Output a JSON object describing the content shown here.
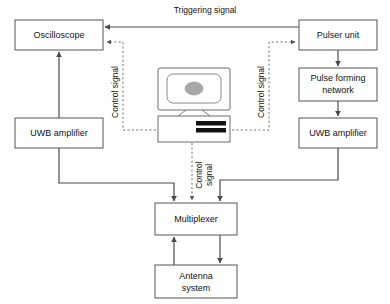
{
  "diagram": {
    "colors": {
      "background": "#ffffff",
      "box_stroke": "#555555",
      "box_fill": "#ffffff",
      "solid_edge": "#4a4a4a",
      "dotted_edge": "#777777",
      "text": "#111111",
      "screen_blob": "#a8a8a8",
      "keyboard_bar": "#111111"
    },
    "blocks": [
      {
        "id": "oscilloscope",
        "label": "Oscilloscope",
        "x": 15,
        "y": 20,
        "w": 88,
        "h": 30
      },
      {
        "id": "uwb_amp_left",
        "label": "UWB amplifier",
        "x": 15,
        "y": 118,
        "w": 88,
        "h": 30
      },
      {
        "id": "pulser_unit",
        "label": "Pulser unit",
        "x": 299,
        "y": 20,
        "w": 78,
        "h": 30
      },
      {
        "id": "pulse_forming",
        "label_line1": "Pulse forming",
        "label_line2": "network",
        "x": 299,
        "y": 68,
        "w": 78,
        "h": 33
      },
      {
        "id": "uwb_amp_right",
        "label": "UWB amplifier",
        "x": 299,
        "y": 118,
        "w": 78,
        "h": 30
      },
      {
        "id": "multiplexer",
        "label": "Multiplexer",
        "x": 155,
        "y": 203,
        "w": 82,
        "h": 32
      },
      {
        "id": "antenna_system",
        "label_line1": "Antenna",
        "label_line2": "system",
        "x": 155,
        "y": 265,
        "w": 82,
        "h": 33
      }
    ],
    "computer": {
      "id": "control-computer",
      "monitor": {
        "x": 158,
        "y": 68,
        "w": 72,
        "h": 42
      },
      "base": {
        "x": 158,
        "y": 116,
        "w": 72,
        "h": 26
      }
    },
    "edge_labels": {
      "triggering_signal": "Triggering signal",
      "control_signal_left": "Control signal",
      "control_signal_right": "Control signal",
      "control_signal_mid_line1": "Control",
      "control_signal_mid_line2": "signal"
    }
  }
}
